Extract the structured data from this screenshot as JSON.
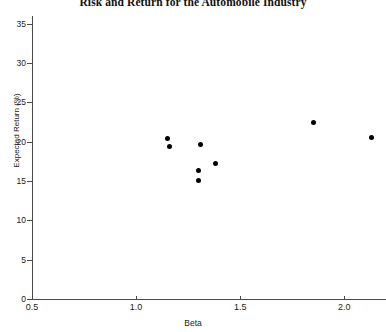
{
  "chart_data": {
    "type": "scatter",
    "title": "Risk and Return for the Automobile Industry",
    "xlabel": "Beta",
    "ylabel": "Expected Return (%)",
    "xlim": [
      0.5,
      2.2
    ],
    "ylim": [
      0,
      36
    ],
    "xticks": [
      0.5,
      1.0,
      1.5,
      2.0
    ],
    "xticklabels": [
      "0.5",
      "1.0",
      "1.5",
      "2.0"
    ],
    "yticks": [
      0,
      5,
      10,
      15,
      20,
      25,
      30,
      35
    ],
    "yticklabels": [
      "0",
      "5",
      "10",
      "15",
      "20",
      "25",
      "30",
      "35"
    ],
    "grid": false,
    "legend": false,
    "marker": "filled-circle",
    "marker_color": "#000000",
    "points": [
      {
        "x": 1.15,
        "y": 20.4
      },
      {
        "x": 1.16,
        "y": 19.4
      },
      {
        "x": 1.31,
        "y": 19.6
      },
      {
        "x": 1.3,
        "y": 16.3
      },
      {
        "x": 1.3,
        "y": 15.1
      },
      {
        "x": 1.38,
        "y": 17.3
      },
      {
        "x": 1.85,
        "y": 22.5
      },
      {
        "x": 2.13,
        "y": 20.6
      }
    ]
  },
  "axes": {
    "x_title": "Beta",
    "y_title": "Expected Return (%)"
  }
}
